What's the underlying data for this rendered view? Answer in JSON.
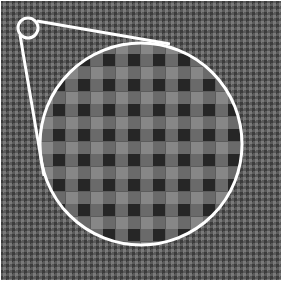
{
  "view": {
    "title": "Magnified pixel pattern",
    "width": 282,
    "height": 281
  },
  "colors": {
    "background_dark": "#3c3c3c",
    "background_mid": "#5a5a5a",
    "background_light": "#7a7a7a",
    "cell_dark": "#262626",
    "cell_mid": "#878787",
    "cell_light": "#6a6a6a",
    "cell_grid": "#5c5c5c",
    "outline": "#ffffff"
  },
  "magnifier": {
    "source_circle": {
      "cx": 28,
      "cy": 28,
      "r": 10
    },
    "lens_circle": {
      "cx": 141,
      "cy": 144,
      "r": 101
    },
    "tangent_lines": [
      {
        "x1": 20,
        "y1": 35,
        "x2": 44,
        "y2": 176
      },
      {
        "x1": 37,
        "y1": 21,
        "x2": 170,
        "y2": 44
      }
    ],
    "cell_size": 12.5,
    "background_dither_size": 3
  }
}
